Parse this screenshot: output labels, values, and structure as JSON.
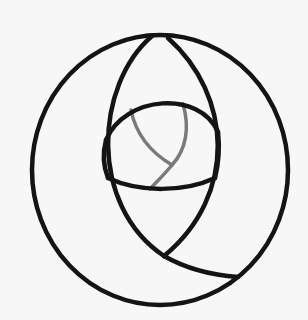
{
  "figure": {
    "background": "#f7f7f7",
    "colors": {
      "primary_stroke": "#141414",
      "secondary_stroke": "#7a7a7a"
    },
    "stroke_widths": {
      "primary": 4.5,
      "secondary": 3.5
    },
    "shapes": {
      "outer_circle": {
        "cx": 160,
        "cy": 170,
        "rx": 128,
        "ry": 135
      },
      "lens_left_arc": "M152 36 C 95 85, 88 205, 164 256",
      "lens_right_arc": "M168 38 C 232 95, 238 195, 164 256",
      "crescent_arc": "M164 256 C 185 268, 210 275, 238 277",
      "eye_top_arc": "M106 140 C 125 95, 200 90, 218 132",
      "eye_bottom_arc": "M108 178 C 140 193, 185 192, 215 178",
      "eye_left_side": "M106 140 C 102 155, 104 168, 108 178",
      "eye_right_side": "M218 132 C 220 150, 218 166, 215 178",
      "gray_arc_left": "M131 110 C 136 135, 150 152, 172 165",
      "gray_arc_right": "M183 104 C 190 128, 186 150, 172 165 C 164 175, 157 181, 150 189"
    }
  }
}
